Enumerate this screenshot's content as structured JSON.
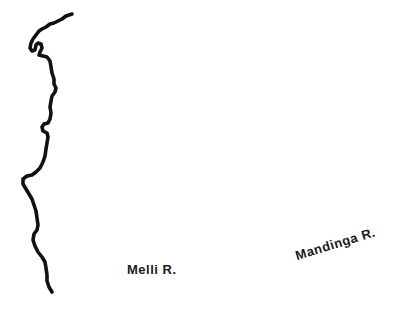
{
  "map": {
    "colors": {
      "coastline": "#111111",
      "background": "#ffffff",
      "label_text": "#1a1a1a"
    },
    "features": [
      {
        "type": "coastline",
        "name": "coastline"
      }
    ],
    "labels": {
      "melli_river": "Melli R.",
      "mandinga_river": "Mandinga R."
    }
  }
}
